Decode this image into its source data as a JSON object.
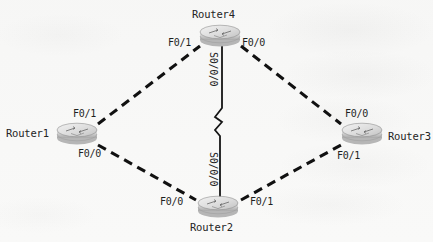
{
  "diagram": {
    "type": "network-topology",
    "background_color": "#f8f8f7",
    "line_color": "#111111",
    "icon_body_color": "#d4d4d4",
    "icon_top_color": "#ededed",
    "nodes": [
      {
        "id": "router4",
        "label": "Router4",
        "x": 220,
        "y": 36,
        "icon": "router-icon"
      },
      {
        "id": "router1",
        "label": "Router1",
        "x": 77,
        "y": 134,
        "icon": "router-icon"
      },
      {
        "id": "router3",
        "label": "Router3",
        "x": 362,
        "y": 134,
        "icon": "router-icon"
      },
      {
        "id": "router2",
        "label": "Router2",
        "x": 218,
        "y": 207,
        "icon": "router-icon"
      }
    ],
    "links": [
      {
        "id": "link-r1-r4",
        "from": "router1",
        "to": "router4",
        "style": "dashed",
        "media": "ethernet"
      },
      {
        "id": "link-r4-r3",
        "from": "router4",
        "to": "router3",
        "style": "dashed",
        "media": "ethernet"
      },
      {
        "id": "link-r1-r2",
        "from": "router1",
        "to": "router2",
        "style": "dashed",
        "media": "ethernet"
      },
      {
        "id": "link-r2-r3",
        "from": "router2",
        "to": "router3",
        "style": "dashed",
        "media": "ethernet"
      },
      {
        "id": "link-r4-r2",
        "from": "router4",
        "to": "router2",
        "style": "solid-zigzag",
        "media": "serial"
      }
    ],
    "port_labels": [
      {
        "id": "r4-f0-1",
        "text": "F0/1",
        "x": 168,
        "y": 37
      },
      {
        "id": "r4-f0-0",
        "text": "F0/0",
        "x": 242,
        "y": 37
      },
      {
        "id": "r1-f0-1",
        "text": "F0/1",
        "x": 73,
        "y": 108
      },
      {
        "id": "r1-f0-0",
        "text": "F0/0",
        "x": 78,
        "y": 148
      },
      {
        "id": "r3-f0-0",
        "text": "F0/0",
        "x": 345,
        "y": 108
      },
      {
        "id": "r3-f0-1",
        "text": "F0/1",
        "x": 337,
        "y": 150
      },
      {
        "id": "r2-f0-0",
        "text": "F0/0",
        "x": 160,
        "y": 196
      },
      {
        "id": "r2-f0-1",
        "text": "F0/1",
        "x": 250,
        "y": 196
      }
    ],
    "serial_labels": [
      {
        "id": "r4-s0-0-0",
        "text": "S0/0/0",
        "x": 219,
        "y": 52
      },
      {
        "id": "r2-s0-0-0",
        "text": "S0/0/0",
        "x": 219,
        "y": 152
      }
    ]
  }
}
